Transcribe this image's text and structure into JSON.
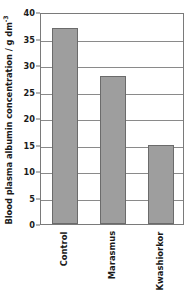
{
  "chart_data": {
    "type": "bar",
    "title": "",
    "xlabel": "",
    "ylabel": "Blood plasma albumin concentration / g dm",
    "ylabel_exponent": "-3",
    "ylabel_full": "Blood plasma albumin concentration / g dm-3",
    "categories": [
      "Control",
      "Marasmus",
      "Kwashiorkor"
    ],
    "values": [
      37,
      28,
      15
    ],
    "ylim": [
      0,
      40
    ],
    "ytick_values": [
      0,
      5,
      10,
      15,
      20,
      25,
      30,
      35,
      40
    ],
    "ytick_labels": [
      "0",
      "5",
      "10",
      "15",
      "20",
      "25",
      "30",
      "35",
      "40"
    ],
    "grid": true,
    "legend": false,
    "bar_color": "#9e9e9e",
    "bar_border_color": "#6b6b6b",
    "axis_color": "#7a7a7a",
    "gridline_color": "#8a8a8a",
    "text_color": "#1a1a1a",
    "background_color": "#ffffff"
  }
}
